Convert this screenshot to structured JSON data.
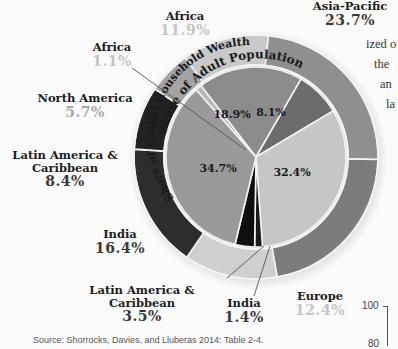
{
  "chart_data": {
    "type": "pie",
    "rings": [
      {
        "name": "Share of Adult Population",
        "position": "outer ring",
        "segments": [
          {
            "label": "Africa",
            "value": 11.9
          },
          {
            "label": "Asia-Pacific",
            "value": 23.7
          },
          {
            "label": "China",
            "value": 21.9
          },
          {
            "label": "Europe",
            "value": 12.4
          },
          {
            "label": "India",
            "value": 16.4
          },
          {
            "label": "Latin America & Caribbean",
            "value": 8.4
          },
          {
            "label": "North America",
            "value": 5.7
          }
        ]
      },
      {
        "name": "Share of Global Household Wealth",
        "position": "inner pie",
        "segments": [
          {
            "label": "Asia-Pacific",
            "value": 18.9
          },
          {
            "label": "China",
            "value": 8.1
          },
          {
            "label": "Europe",
            "value": 32.4
          },
          {
            "label": "India",
            "value": 1.4
          },
          {
            "label": "Latin America & Caribbean",
            "value": 3.5
          },
          {
            "label": "North America",
            "value": 34.7
          },
          {
            "label": "Africa",
            "value": 1.1
          }
        ]
      }
    ],
    "source": "Source: Shorrocks, Davies, and Lluberas 2014: Table 2-4."
  },
  "labels": {
    "africa_pop": {
      "name": "Africa",
      "pct": "11.9%"
    },
    "asia_pop": {
      "name": "Asia-Pacific",
      "pct": "23.7%"
    },
    "africa_wealth": {
      "name": "Africa",
      "pct": "1.1%"
    },
    "na_pop": {
      "name": "North America",
      "pct": "5.7%"
    },
    "latam_pop": {
      "name1": "Latin America &",
      "name2": "Caribbean",
      "pct": "8.4%"
    },
    "india_pop": {
      "name": "India",
      "pct": "16.4%"
    },
    "latam_wealth": {
      "name1": "Latin America &",
      "name2": "Caribbean",
      "pct": "3.5%"
    },
    "india_wealth": {
      "name": "India",
      "pct": "1.4%"
    },
    "europe_pop": {
      "name": "Europe",
      "pct": "12.4%"
    },
    "inner_values": {
      "na": "34.7%",
      "asia": "18.9%",
      "china": "8.1%",
      "europe": "32.4%"
    },
    "ring_titles": {
      "outer": "Share of Adult Population",
      "inner": "Share of Global Household Wealth"
    }
  },
  "side_text": [
    "ized o",
    "the",
    "an",
    "la"
  ],
  "axis": {
    "ticks": [
      "100",
      "80"
    ]
  },
  "source": "Source: Shorrocks, Davies, and Lluberas 2014: Table 2-4."
}
